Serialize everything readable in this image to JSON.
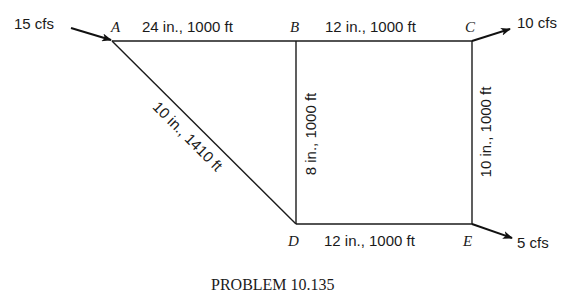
{
  "diagram": {
    "type": "pipe-network",
    "nodes": [
      {
        "id": "A",
        "label": "A"
      },
      {
        "id": "B",
        "label": "B"
      },
      {
        "id": "C",
        "label": "C"
      },
      {
        "id": "D",
        "label": "D"
      },
      {
        "id": "E",
        "label": "E"
      }
    ],
    "pipes": [
      {
        "from": "A",
        "to": "B",
        "label": "24 in., 1000 ft",
        "diameter_in": 24,
        "length_ft": 1000
      },
      {
        "from": "B",
        "to": "C",
        "label": "12 in., 1000 ft",
        "diameter_in": 12,
        "length_ft": 1000
      },
      {
        "from": "A",
        "to": "D",
        "label": "10 in., 1410 ft",
        "diameter_in": 10,
        "length_ft": 1410
      },
      {
        "from": "B",
        "to": "D",
        "label": "8 in., 1000 ft",
        "diameter_in": 8,
        "length_ft": 1000
      },
      {
        "from": "C",
        "to": "E",
        "label": "10 in., 1000 ft",
        "diameter_in": 10,
        "length_ft": 1000
      },
      {
        "from": "D",
        "to": "E",
        "label": "12 in., 1000 ft",
        "diameter_in": 12,
        "length_ft": 1000
      }
    ],
    "flows": [
      {
        "node": "A",
        "direction": "in",
        "label": "15 cfs",
        "value_cfs": 15
      },
      {
        "node": "C",
        "direction": "out",
        "label": "10 cfs",
        "value_cfs": 10
      },
      {
        "node": "E",
        "direction": "out",
        "label": "5 cfs",
        "value_cfs": 5
      }
    ],
    "caption": "PROBLEM 10.135"
  }
}
